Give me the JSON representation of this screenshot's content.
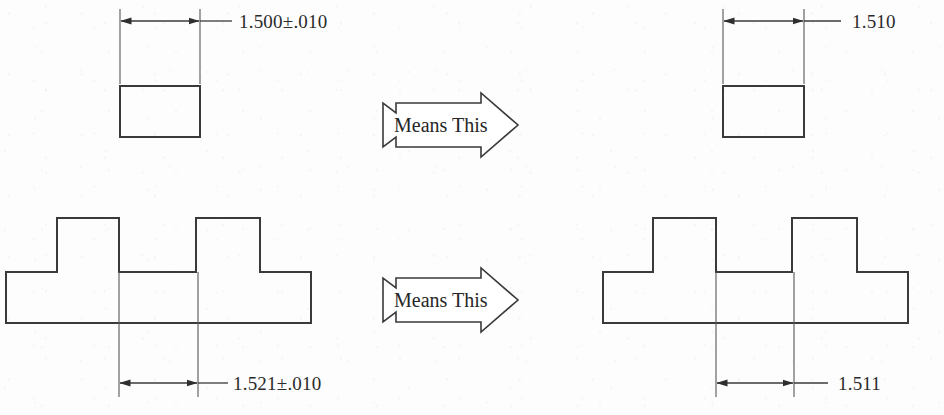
{
  "figure": {
    "background_color": "#fdfdfd",
    "line_color": "#3a3a3a",
    "text_color": "#2b2b2b"
  },
  "rows": [
    {
      "id": "row-top",
      "left": {
        "shape": "rectangle",
        "dimension_label": "1.500±.010",
        "nominal": "1.500",
        "tolerance": "±.010"
      },
      "connector": {
        "label": "Means This",
        "icon": "right-block-arrow"
      },
      "right": {
        "shape": "rectangle",
        "dimension_label": "1.510",
        "nominal": "1.510",
        "tolerance": ""
      }
    },
    {
      "id": "row-bottom",
      "left": {
        "shape": "stepped-double-boss",
        "dimension_label": "1.521±.010",
        "nominal": "1.521",
        "tolerance": "±.010"
      },
      "connector": {
        "label": "Means This",
        "icon": "right-block-arrow"
      },
      "right": {
        "shape": "stepped-double-boss",
        "dimension_label": "1.511",
        "nominal": "1.511",
        "tolerance": ""
      }
    }
  ]
}
